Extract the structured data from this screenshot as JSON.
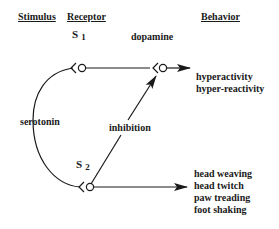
{
  "headers": {
    "stimulus": "Stimulus",
    "receptor": "Receptor",
    "behavior": "Behavior"
  },
  "receptors": {
    "s1": {
      "letter": "S",
      "index": "1"
    },
    "s2": {
      "letter": "S",
      "index": "2"
    }
  },
  "labels": {
    "serotonin": "serotonin",
    "dopamine": "dopamine",
    "inhibition": "inhibition"
  },
  "behaviors": {
    "s1": [
      "hyperactivity",
      "hyper-reactivity"
    ],
    "s2": [
      "head weaving",
      "head twitch",
      "paw treading",
      "foot shaking"
    ]
  },
  "colors": {
    "line": "#1a1a1a",
    "background": "#ffffff"
  }
}
